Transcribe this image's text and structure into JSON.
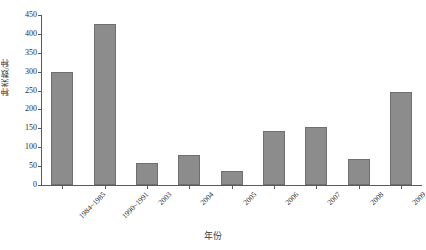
{
  "chart_data": {
    "type": "bar",
    "title": "",
    "xlabel": "年份",
    "ylabel": "种类数/种",
    "categories": [
      "1984~1985",
      "1990~1991",
      "2003",
      "2004",
      "2005",
      "2006",
      "2007",
      "2008",
      "2009"
    ],
    "values": [
      300,
      425,
      57,
      80,
      37,
      143,
      153,
      68,
      245
    ],
    "ylim": [
      0,
      450
    ],
    "yticks": [
      0,
      50,
      100,
      150,
      200,
      250,
      300,
      350,
      400,
      450
    ],
    "ytick_labels": [
      "0",
      "50",
      "100",
      "150",
      "200",
      "250",
      "300",
      "350",
      "400",
      "450"
    ],
    "grid": false,
    "legend": null,
    "series": [
      {
        "name": "种类数",
        "values": [
          300,
          425,
          57,
          80,
          37,
          143,
          153,
          68,
          245
        ],
        "color": "#8c8c8c",
        "edge_color": "#6f6f6f"
      }
    ]
  },
  "colors": {
    "bar_fill": "#8c8c8c",
    "bar_edge": "#6f6f6f",
    "axis": "#5a5a5a",
    "text": "#2b2b2b",
    "background": "#ffffff"
  }
}
